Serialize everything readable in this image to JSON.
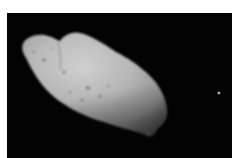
{
  "image": {
    "subject": "asteroid with small moon",
    "background_color": "#030303",
    "border_color": "#ffffff",
    "asteroid_color": "#b8b8b8",
    "moon_color": "#c8c8c8"
  }
}
